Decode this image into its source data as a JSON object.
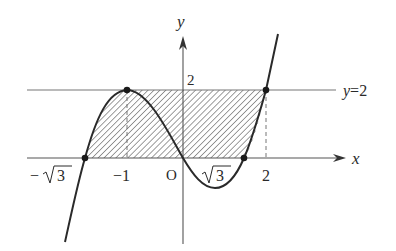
{
  "figure": {
    "function": "y = x^3 - 3x",
    "axis_labels": {
      "x": "x",
      "y": "y"
    },
    "origin_label": "O",
    "x_ticks": [
      {
        "label_minus": "−",
        "label_root": "3",
        "value": "-√3"
      },
      {
        "label": "−1",
        "value": -1
      },
      {
        "label_root": "3",
        "value": "√3"
      },
      {
        "label": "2",
        "value": 2
      }
    ],
    "y_tick": {
      "label": "2",
      "value": 2
    },
    "horizontal_line": {
      "label_var": "y",
      "label_eq": "=2",
      "value": 2
    },
    "marked_points": [
      {
        "x": "-√3",
        "y": 0
      },
      {
        "x": -1,
        "y": 2
      },
      {
        "x": "√3",
        "y": 0
      },
      {
        "x": 2,
        "y": 2
      }
    ],
    "shaded_region": "between y=0 and y=2, bounded by the curve on left (from -√3 to -1) and right (from √3 to 2)",
    "colors": {
      "curve": "#2a2a2a",
      "axis": "#555555",
      "line_y2": "#777777",
      "hatch": "#6a6a6a",
      "point": "#1a1a1a"
    }
  }
}
